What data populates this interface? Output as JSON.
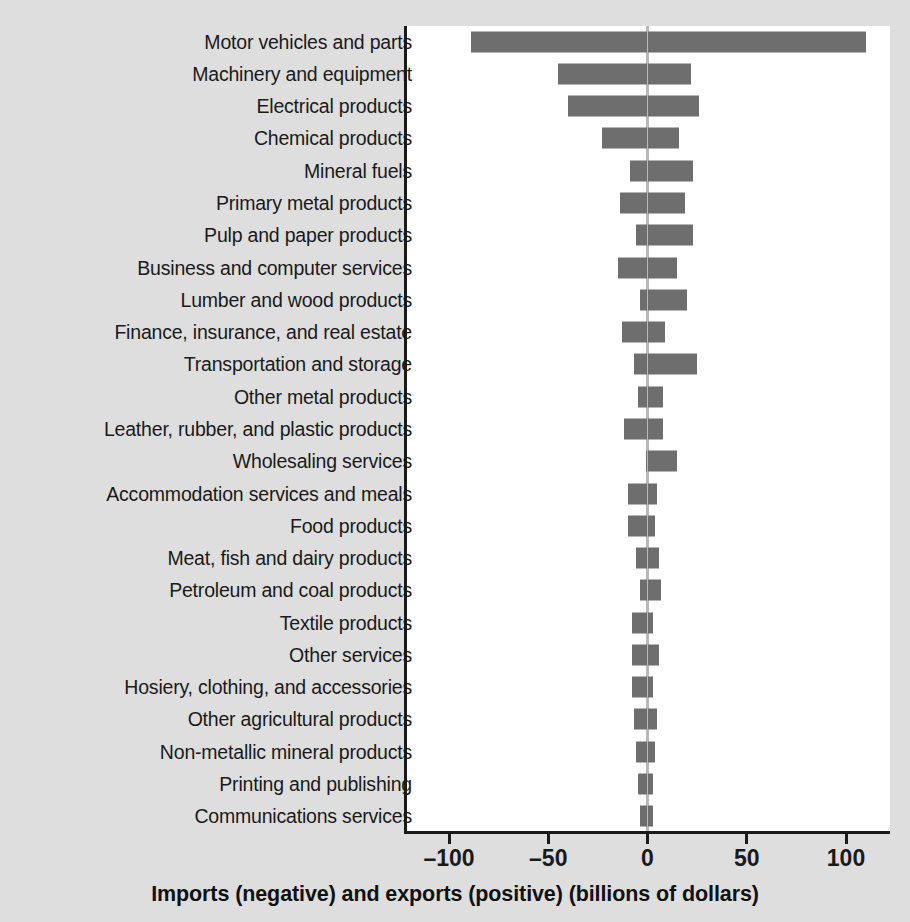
{
  "chart_data": {
    "type": "bar",
    "orientation": "horizontal",
    "title": "",
    "xlabel": "Imports (negative) and exports (positive) (billions of dollars)",
    "ylabel": "",
    "xlim": [
      -110,
      120
    ],
    "xticks": [
      -100,
      -50,
      0,
      50,
      100
    ],
    "xticklabels": [
      "–100",
      "–50",
      "0",
      "50",
      "100"
    ],
    "grid": false,
    "legend": null,
    "zero_reference_line": true,
    "bar_color": "#6e6e6e",
    "zero_line_color": "#b9b9b9",
    "axis_color": "#1a1a1a",
    "panel_background": "#ffffff",
    "figure_background": "#dedede",
    "categories": [
      "Motor vehicles and parts",
      "Machinery and equipment",
      "Electrical products",
      "Chemical products",
      "Mineral fuels",
      "Primary metal products",
      "Pulp and paper products",
      "Business and computer services",
      "Lumber and wood products",
      "Finance, insurance, and real estate",
      "Transportation and storage",
      "Other metal products",
      "Leather, rubber, and plastic products",
      "Wholesaling services",
      "Accommodation services and meals",
      "Food products",
      "Meat, fish and dairy products",
      "Petroleum and coal products",
      "Textile products",
      "Other services",
      "Hosiery, clothing, and accessories",
      "Other agricultural products",
      "Non-metallic mineral products",
      "Printing and publishing",
      "Communications services"
    ],
    "series": [
      {
        "name": "Imports (negative)",
        "values": [
          -89,
          -45,
          -40,
          -23,
          -9,
          -14,
          -6,
          -15,
          -4,
          -13,
          -7,
          -5,
          -12,
          -1,
          -10,
          -10,
          -6,
          -4,
          -8,
          -8,
          -8,
          -7,
          -6,
          -5,
          -4
        ]
      },
      {
        "name": "Exports (positive)",
        "values": [
          110,
          22,
          26,
          16,
          23,
          19,
          23,
          15,
          20,
          9,
          25,
          8,
          8,
          15,
          5,
          4,
          6,
          7,
          3,
          6,
          3,
          5,
          4,
          3,
          3
        ]
      }
    ]
  },
  "axis": {
    "title": "Imports (negative) and exports (positive) (billions of dollars)",
    "ticks": [
      {
        "value": -100,
        "label": "–100"
      },
      {
        "value": -50,
        "label": "–50"
      },
      {
        "value": 0,
        "label": "0"
      },
      {
        "value": 50,
        "label": "50"
      },
      {
        "value": 100,
        "label": "100"
      }
    ]
  }
}
